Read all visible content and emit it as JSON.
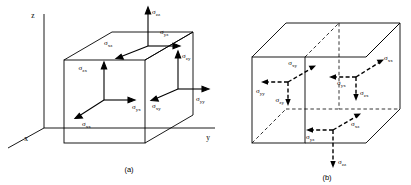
{
  "figure": {
    "kind": "stress-tensor-cube-diagram",
    "stroke_color": "#000000",
    "background": "#ffffff",
    "sigma_glyph": "σ",
    "axes": {
      "z_label": "z",
      "x_label": "x",
      "y_label": "y"
    },
    "panels": [
      {
        "id": "a",
        "caption": "(a)",
        "face_style": "solid",
        "labels": [
          {
            "name": "sigma-zz",
            "base": "σ",
            "sub": "zz",
            "x": 152,
            "y": 14,
            "anchor": "start"
          },
          {
            "name": "sigma-yz",
            "base": "σ",
            "sub": "yz",
            "x": 160,
            "y": 34,
            "anchor": "start"
          },
          {
            "name": "sigma-xz",
            "base": "σ",
            "sub": "xz",
            "x": 104,
            "y": 45,
            "anchor": "start"
          },
          {
            "name": "sigma-zx",
            "base": "σ",
            "sub": "zx",
            "x": 87,
            "y": 70,
            "anchor": "end"
          },
          {
            "name": "sigma-yx",
            "base": "σ",
            "sub": "yx",
            "x": 132,
            "y": 104,
            "anchor": "start"
          },
          {
            "name": "sigma-xx",
            "base": "σ",
            "sub": "xx",
            "x": 90,
            "y": 122,
            "anchor": "start"
          },
          {
            "name": "sigma-zy",
            "base": "σ",
            "sub": "zy",
            "x": 185,
            "y": 58,
            "anchor": "start"
          },
          {
            "name": "sigma-xy",
            "base": "σ",
            "sub": "xy",
            "x": 162,
            "y": 104,
            "anchor": "start"
          },
          {
            "name": "sigma-yy",
            "base": "σ",
            "sub": "yy",
            "x": 196,
            "y": 101,
            "anchor": "start"
          }
        ]
      },
      {
        "id": "b",
        "caption": "(b)",
        "face_style": "dashed",
        "labels": [
          {
            "name": "sigma-xy",
            "base": "σ",
            "sub": "xy",
            "x": 297,
            "y": 65,
            "anchor": "start"
          },
          {
            "name": "sigma-yy",
            "base": "σ",
            "sub": "yy",
            "x": 256,
            "y": 92,
            "anchor": "start"
          },
          {
            "name": "sigma-zy",
            "base": "σ",
            "sub": "zy",
            "x": 266,
            "y": 108,
            "anchor": "end"
          },
          {
            "name": "sigma-xx",
            "base": "σ",
            "sub": "xx",
            "x": 379,
            "y": 62,
            "anchor": "start"
          },
          {
            "name": "sigma-yx",
            "base": "σ",
            "sub": "yx",
            "x": 340,
            "y": 72,
            "anchor": "start"
          },
          {
            "name": "sigma-zx",
            "base": "σ",
            "sub": "zx",
            "x": 367,
            "y": 97,
            "anchor": "start"
          },
          {
            "name": "sigma-xz",
            "base": "σ",
            "sub": "xz",
            "x": 355,
            "y": 125,
            "anchor": "start"
          },
          {
            "name": "sigma-yz",
            "base": "σ",
            "sub": "yz",
            "x": 305,
            "y": 136,
            "anchor": "start"
          },
          {
            "name": "sigma-zz",
            "base": "σ",
            "sub": "zz",
            "x": 337,
            "y": 174,
            "anchor": "start"
          }
        ]
      }
    ]
  }
}
